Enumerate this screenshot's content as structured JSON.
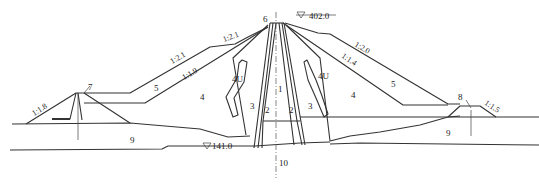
{
  "diagram": {
    "type": "dam cross-section",
    "zone_labels": {
      "z1": "1",
      "z2_left": "2",
      "z2_right": "2",
      "z3_left": "3",
      "z3_right": "3",
      "z4_left": "4",
      "z4_right": "4",
      "z4u_left": "4U",
      "z4u_right": "4U",
      "z5_left": "5",
      "z5_right": "5",
      "z6": "6",
      "z7": "7",
      "z8": "8",
      "z9_left": "9",
      "z9_right": "9",
      "z10": "10"
    },
    "elevations": {
      "crest": "402.0",
      "foundation": "141.0"
    },
    "slopes": {
      "upstream_upper": "1:2.1",
      "upstream_middle": "1:2.1",
      "upstream_inner": "1:1.9",
      "upstream_cofferdam": "1:1.8",
      "downstream_outer": "1:2.0",
      "downstream_inner": "1:1.4",
      "downstream_toe": "1:1.5"
    },
    "colors": {
      "line": "#333333",
      "background": "#ffffff"
    }
  }
}
